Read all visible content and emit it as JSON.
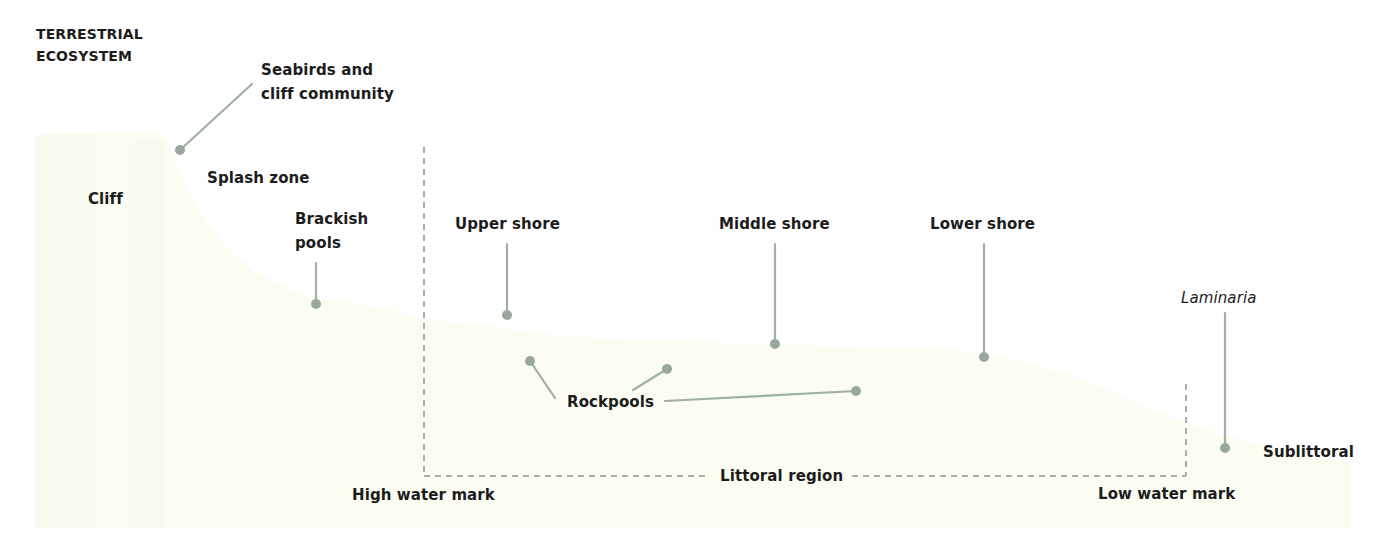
{
  "diagram": {
    "type": "rocky-shore-zonation-cross-section",
    "colors": {
      "background": "#ffffff",
      "land_fill": "#fbfcf2",
      "land_fill_shade": "#f6f8ea",
      "leader_line": "#9fb0a4",
      "leader_dot": "#98a89c",
      "dashed_boundary": "#a9aeaa",
      "text": "#1c1c1c"
    },
    "labels": {
      "terrestrial": "TERRESTRIAL\nECOSYSTEM",
      "seabirds": "Seabirds and\ncliff community",
      "cliff": "Cliff",
      "splash_zone": "Splash zone",
      "brackish_pools": "Brackish\npools",
      "upper_shore": "Upper shore",
      "middle_shore": "Middle shore",
      "lower_shore": "Lower shore",
      "laminaria": "Laminaria",
      "rockpools": "Rockpools",
      "sublittoral": "Sublittoral",
      "littoral_region": "Littoral region",
      "high_water_mark": "High water mark",
      "low_water_mark": "Low water mark"
    },
    "leaders": [
      {
        "name": "seabirds",
        "from": [
          252,
          84
        ],
        "to": [
          180,
          150
        ]
      },
      {
        "name": "brackish-pools",
        "from": [
          316,
          263
        ],
        "to": [
          316,
          304
        ]
      },
      {
        "name": "upper-shore",
        "from": [
          507,
          244
        ],
        "to": [
          507,
          315
        ]
      },
      {
        "name": "middle-shore",
        "from": [
          775,
          244
        ],
        "to": [
          775,
          344
        ]
      },
      {
        "name": "lower-shore",
        "from": [
          984,
          244
        ],
        "to": [
          984,
          357
        ]
      },
      {
        "name": "laminaria",
        "from": [
          1225,
          313
        ],
        "to": [
          1225,
          448
        ]
      },
      {
        "name": "rockpool-1",
        "from": [
          555,
          398
        ],
        "to": [
          530,
          361
        ]
      },
      {
        "name": "rockpool-2",
        "from": [
          633,
          390
        ],
        "to": [
          667,
          369
        ]
      },
      {
        "name": "rockpool-3",
        "from": [
          665,
          401
        ],
        "to": [
          856,
          391
        ]
      }
    ],
    "boundaries": {
      "high_water_x": 424,
      "low_water_x": 1186,
      "top_high": 147,
      "top_low": 384,
      "baseline_y": 476
    }
  }
}
